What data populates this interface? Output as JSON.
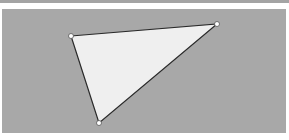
{
  "colors": {
    "background": "#a8a8a8",
    "fill": "#efefef",
    "stroke": "#2a2a2a",
    "handle": "#ffffff"
  },
  "triangle": {
    "vertices": [
      {
        "x": 71,
        "y": 36
      },
      {
        "x": 217,
        "y": 24
      },
      {
        "x": 99,
        "y": 123
      }
    ]
  }
}
